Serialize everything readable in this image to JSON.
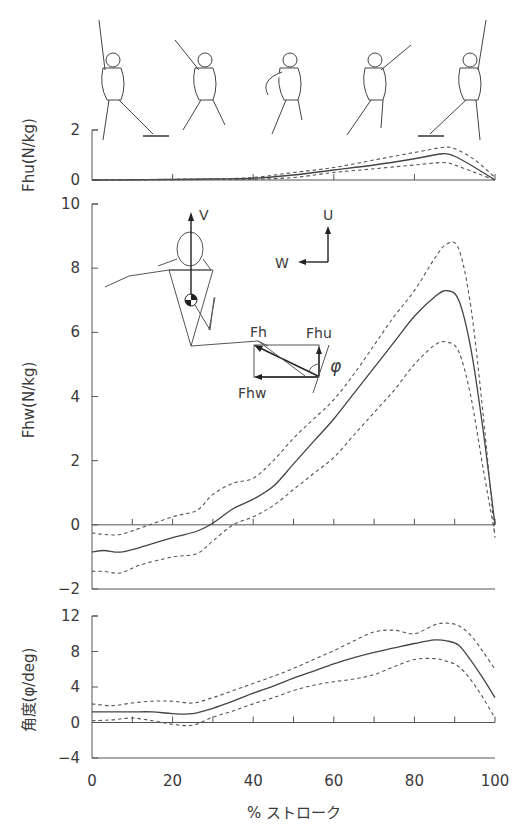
{
  "figure": {
    "skater_figures": [
      "skater-pose-1",
      "skater-pose-2",
      "skater-pose-3",
      "skater-pose-4",
      "skater-pose-5"
    ],
    "inset_diagram": {
      "labels": {
        "V": "V",
        "U": "U",
        "W": "W",
        "Fh": "Fh",
        "Fhu": "Fhu",
        "Fhw": "Fhw",
        "phi": "φ"
      }
    }
  },
  "chart_data": [
    {
      "type": "line",
      "panel": "top",
      "title": "",
      "xlabel": "% ストローク",
      "ylabel": "Fhu(N/kg)",
      "xlim": [
        0,
        100
      ],
      "ylim": [
        0,
        2
      ],
      "yticks": [
        0,
        2
      ],
      "xticks_minor": [
        0,
        10,
        20,
        30,
        40,
        50,
        60,
        70,
        80,
        90,
        100
      ],
      "x": [
        0,
        10,
        20,
        30,
        40,
        50,
        60,
        70,
        80,
        87,
        90,
        95,
        100
      ],
      "series": [
        {
          "name": "mean",
          "style": "solid",
          "values": [
            0,
            0.01,
            0.02,
            0.04,
            0.07,
            0.2,
            0.4,
            0.6,
            0.85,
            1.05,
            0.95,
            0.5,
            0
          ]
        },
        {
          "name": "mean+SD",
          "style": "dashed",
          "values": [
            0,
            0.01,
            0.03,
            0.05,
            0.1,
            0.3,
            0.5,
            0.8,
            1.1,
            1.3,
            1.25,
            0.8,
            0.1
          ]
        },
        {
          "name": "mean-SD",
          "style": "dashed",
          "values": [
            0,
            0,
            0.01,
            0.02,
            0.03,
            0.1,
            0.3,
            0.45,
            0.6,
            0.7,
            0.6,
            0.3,
            0
          ]
        }
      ]
    },
    {
      "type": "line",
      "panel": "middle",
      "title": "",
      "xlabel": "% ストローク",
      "ylabel": "Fhw(N/kg)",
      "xlim": [
        0,
        100
      ],
      "ylim": [
        -2,
        10
      ],
      "yticks": [
        -2,
        0,
        2,
        4,
        6,
        8,
        10
      ],
      "x": [
        0,
        3,
        7,
        12,
        20,
        26,
        30,
        35,
        40,
        45,
        50,
        55,
        60,
        65,
        70,
        75,
        80,
        85,
        88,
        91,
        94,
        97,
        100
      ],
      "series": [
        {
          "name": "mean",
          "style": "solid",
          "values": [
            -0.85,
            -0.8,
            -0.85,
            -0.7,
            -0.4,
            -0.2,
            0.05,
            0.5,
            0.8,
            1.2,
            1.9,
            2.6,
            3.3,
            4.1,
            4.9,
            5.7,
            6.5,
            7.1,
            7.3,
            7.0,
            5.5,
            3.0,
            0
          ]
        },
        {
          "name": "mean+SD",
          "style": "dashed",
          "values": [
            -0.25,
            -0.3,
            -0.3,
            -0.1,
            0.25,
            0.45,
            0.95,
            1.3,
            1.45,
            2.0,
            2.7,
            3.3,
            3.9,
            4.7,
            5.6,
            6.5,
            7.3,
            8.3,
            8.75,
            8.6,
            6.8,
            3.5,
            -0.4
          ]
        },
        {
          "name": "mean-SD",
          "style": "dashed",
          "values": [
            -1.45,
            -1.45,
            -1.5,
            -1.25,
            -1.0,
            -0.9,
            -0.5,
            0,
            0.25,
            0.6,
            1.1,
            1.6,
            2.1,
            2.8,
            3.5,
            4.2,
            5.0,
            5.6,
            5.7,
            5.4,
            4.0,
            1.8,
            -0.3
          ]
        }
      ]
    },
    {
      "type": "line",
      "panel": "bottom",
      "title": "",
      "xlabel": "% ストローク",
      "ylabel": "角度(φ/deg)",
      "xlim": [
        0,
        100
      ],
      "ylim": [
        -4,
        12
      ],
      "yticks": [
        -4,
        0,
        4,
        8,
        12
      ],
      "xticks": [
        0,
        20,
        40,
        60,
        80,
        100
      ],
      "x": [
        0,
        5,
        10,
        15,
        20,
        25,
        30,
        35,
        40,
        45,
        50,
        55,
        60,
        65,
        70,
        75,
        80,
        85,
        88,
        91,
        94,
        97,
        100
      ],
      "series": [
        {
          "name": "mean",
          "style": "solid",
          "values": [
            1.2,
            1.2,
            1.2,
            1.2,
            1.0,
            1.0,
            1.6,
            2.4,
            3.3,
            4.1,
            5.0,
            5.8,
            6.6,
            7.3,
            7.9,
            8.4,
            8.9,
            9.3,
            9.2,
            8.7,
            7.0,
            5.0,
            2.8
          ]
        },
        {
          "name": "mean+SD",
          "style": "dashed",
          "values": [
            2.1,
            1.9,
            2.2,
            2.4,
            2.4,
            2.2,
            2.8,
            3.6,
            4.4,
            5.2,
            6.1,
            7.1,
            8.1,
            9.2,
            10.2,
            10.4,
            10.0,
            11.0,
            11.2,
            10.9,
            9.8,
            8.0,
            6.0
          ]
        },
        {
          "name": "mean-SD",
          "style": "dashed",
          "values": [
            0.2,
            0.3,
            0.5,
            0.2,
            -0.2,
            -0.3,
            0.6,
            1.3,
            2.1,
            2.8,
            3.6,
            4.2,
            4.6,
            4.9,
            5.4,
            6.3,
            7.1,
            7.2,
            6.9,
            6.3,
            4.8,
            2.8,
            0.5
          ]
        }
      ]
    }
  ],
  "axes_text": {
    "top_ylabel": "Fhu(N/kg)",
    "mid_ylabel": "Fhw(N/kg)",
    "bot_ylabel": "角度(φ/deg)",
    "xlabel": "% ストローク"
  }
}
